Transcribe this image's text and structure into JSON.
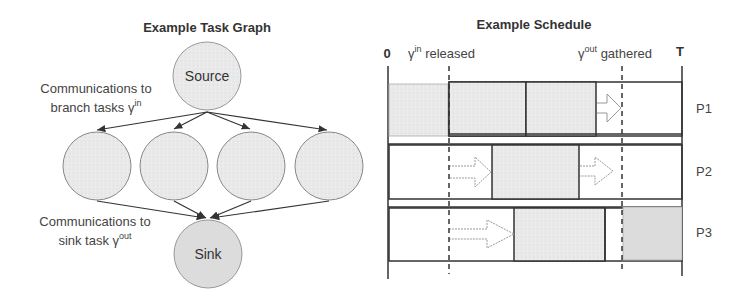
{
  "task_graph": {
    "title": "Example Task Graph",
    "source_label": "Source",
    "sink_label": "Sink",
    "branch_count": 4,
    "annotation_in": {
      "text": "Communications to",
      "text2": "branch tasks γ",
      "sup": "in"
    },
    "annotation_out": {
      "text": "Communications to",
      "text2": "sink task γ",
      "sup": "out"
    }
  },
  "schedule": {
    "title": "Example Schedule",
    "axis_start": "0",
    "axis_end": "T",
    "marker_in": {
      "prefix": "γ",
      "sup": "in",
      "text": " released"
    },
    "marker_out": {
      "prefix": "γ",
      "sup": "out",
      "text": " gathered"
    },
    "processors": [
      "P1",
      "P2",
      "P3"
    ]
  },
  "colors": {
    "fill": "#e8e8e8",
    "stroke": "#333333"
  }
}
